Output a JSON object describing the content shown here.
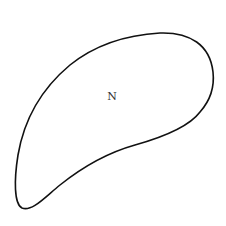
{
  "diagram": {
    "shape": {
      "type": "closed-curve",
      "stroke_color": "#111111",
      "fill_color": "#ffffff"
    },
    "label": {
      "text": "N",
      "x": 112,
      "y": 100
    }
  }
}
